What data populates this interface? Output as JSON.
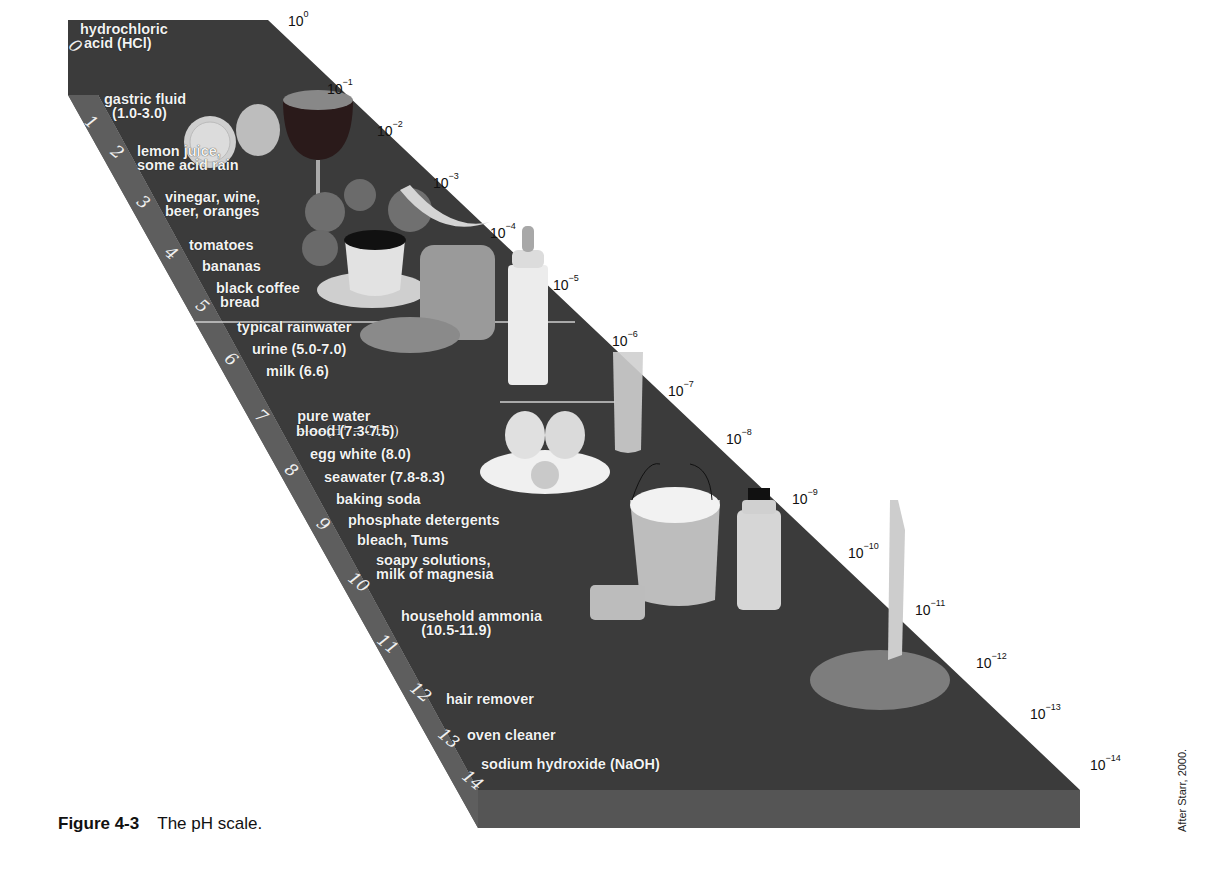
{
  "figure": {
    "number": "Figure 4-3",
    "title": "The pH scale.",
    "credit": "After Starr, 2000."
  },
  "scale": {
    "ph_numbers": [
      "0",
      "1",
      "2",
      "3",
      "4",
      "5",
      "6",
      "7",
      "8",
      "9",
      "10",
      "11",
      "12",
      "13",
      "14"
    ],
    "concentrations": [
      {
        "base": "10",
        "exp": "0"
      },
      {
        "base": "10",
        "exp": "−1"
      },
      {
        "base": "10",
        "exp": "−2"
      },
      {
        "base": "10",
        "exp": "−3"
      },
      {
        "base": "10",
        "exp": "−4"
      },
      {
        "base": "10",
        "exp": "−5"
      },
      {
        "base": "10",
        "exp": "−6"
      },
      {
        "base": "10",
        "exp": "−7"
      },
      {
        "base": "10",
        "exp": "−8"
      },
      {
        "base": "10",
        "exp": "−9"
      },
      {
        "base": "10",
        "exp": "−10"
      },
      {
        "base": "10",
        "exp": "−11"
      },
      {
        "base": "10",
        "exp": "−12"
      },
      {
        "base": "10",
        "exp": "−13"
      },
      {
        "base": "10",
        "exp": "−14"
      }
    ]
  },
  "substances": [
    {
      "label": "hydrochloric\n acid (HCl)"
    },
    {
      "label": "gastric fluid\n  (1.0-3.0)"
    },
    {
      "label": "lemon juice,\nsome acid rain"
    },
    {
      "label": "vinegar, wine,\nbeer, oranges"
    },
    {
      "label": "tomatoes"
    },
    {
      "label": "bananas"
    },
    {
      "label": "black coffee\n bread"
    },
    {
      "label": "typical rainwater"
    },
    {
      "label": "urine (5.0-7.0)"
    },
    {
      "label": "milk (6.6)"
    },
    {
      "label": "pure water"
    },
    {
      "label": "blood (7.3-7.5)"
    },
    {
      "label": "egg white (8.0)"
    },
    {
      "label": "seawater (7.8-8.3)"
    },
    {
      "label": "baking soda"
    },
    {
      "label": "phosphate detergents"
    },
    {
      "label": "bleach, Tums"
    },
    {
      "label": "soapy solutions,\nmilk of magnesia"
    },
    {
      "label": "household ammonia\n     (10.5-11.9)"
    },
    {
      "label": "hair remover"
    },
    {
      "label": "oven cleaner"
    },
    {
      "label": "sodium hydroxide (NaOH)"
    }
  ],
  "neutral_equation": "——(H⁺ = OH⁻)",
  "images": [
    "lemon",
    "wine-glass",
    "tomatoes",
    "bananas",
    "coffee-cup",
    "bread",
    "baby-bottle",
    "water-glass",
    "egg",
    "bucket",
    "sponge",
    "bleach-bottle",
    "leg-in-foam"
  ],
  "colors": {
    "top_face": "#3b3b3b",
    "side_face": "#5e5e5e",
    "front_face": "#555555",
    "text": "#f2f2f2"
  }
}
